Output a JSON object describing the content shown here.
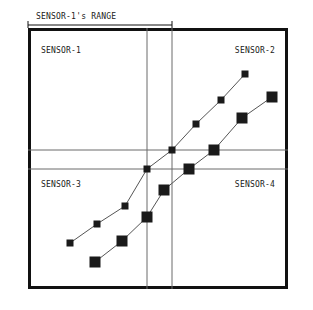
{
  "figure": {
    "annotation": {
      "label": "SENSOR-1's  RANGE",
      "name": "range-annotation",
      "x": 36,
      "y": 19,
      "arrow": {
        "x1": 28,
        "x2": 172,
        "y": 25
      }
    },
    "frame": {
      "x": 28,
      "y": 28,
      "width": 260,
      "height": 261,
      "border_color": "#111111",
      "border_width": 3,
      "fill": "#ffffff"
    },
    "gridlines": {
      "color": "#6b6b6b",
      "width": 1,
      "vertical": [
        147,
        172
      ],
      "horizontal": [
        150,
        169
      ]
    },
    "quadrant_labels": [
      {
        "name": "quadrant-label-sensor-1",
        "text": "SENSOR-1",
        "x": 41,
        "y": 53,
        "anchor": "start"
      },
      {
        "name": "quadrant-label-sensor-2",
        "text": "SENSOR-2",
        "x": 275,
        "y": 53,
        "anchor": "end"
      },
      {
        "name": "quadrant-label-sensor-3",
        "text": "SENSOR-3",
        "x": 41,
        "y": 187,
        "anchor": "start"
      },
      {
        "name": "quadrant-label-sensor-4",
        "text": "SENSOR-4",
        "x": 275,
        "y": 187,
        "anchor": "end"
      }
    ]
  },
  "chart_data": {
    "type": "scatter",
    "title": "SENSOR-1's  RANGE",
    "xlabel": "",
    "ylabel": "",
    "xlim": [
      28,
      288
    ],
    "ylim": [
      28,
      289
    ],
    "grid": true,
    "legend": "none",
    "annotations": [
      "SENSOR-1's  RANGE",
      "SENSOR-1",
      "SENSOR-2",
      "SENSOR-3",
      "SENSOR-4"
    ],
    "series": [
      {
        "name": "series-a",
        "marker": "square",
        "marker_size": 7,
        "color": "#1a1a1a",
        "line_color": "#555555",
        "points": [
          {
            "x": 70,
            "y": 243
          },
          {
            "x": 97,
            "y": 224
          },
          {
            "x": 125,
            "y": 206
          },
          {
            "x": 147,
            "y": 169
          },
          {
            "x": 172,
            "y": 150
          },
          {
            "x": 196,
            "y": 124
          },
          {
            "x": 221,
            "y": 100
          },
          {
            "x": 245,
            "y": 74
          }
        ]
      },
      {
        "name": "series-b",
        "marker": "square",
        "marker_size": 11,
        "color": "#1a1a1a",
        "line_color": "#555555",
        "points": [
          {
            "x": 95,
            "y": 262
          },
          {
            "x": 122,
            "y": 241
          },
          {
            "x": 147,
            "y": 217
          },
          {
            "x": 164,
            "y": 190
          },
          {
            "x": 189,
            "y": 169
          },
          {
            "x": 214,
            "y": 150
          },
          {
            "x": 242,
            "y": 118
          },
          {
            "x": 272,
            "y": 97
          }
        ]
      }
    ]
  }
}
